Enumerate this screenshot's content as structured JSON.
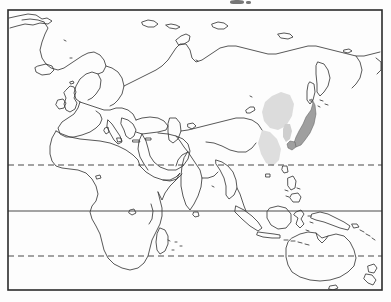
{
  "figure": {
    "kind": "world-outline-map",
    "projection_note": "rectangular cylindrical",
    "centered_on": "Eurasia, Africa, Australia",
    "image_width": 391,
    "image_height": 302,
    "background_color": "#fdfdfd",
    "coastline_color": "#3a3a3a",
    "border_color": "#2b2b2b",
    "gridline_color": "#4a4a4a",
    "shading_color_dark": "#9a9a9a",
    "shading_color_light": "#d6d6d6",
    "title": "",
    "caption": "",
    "labels": []
  },
  "frame": {
    "name": "map-border",
    "x": 8,
    "y": 10,
    "width": 374,
    "height": 280,
    "stroke_width": 1.6
  },
  "gridlines": [
    {
      "name": "tropic-of-cancer",
      "style": "dashed",
      "y": 165,
      "label": ""
    },
    {
      "name": "equator",
      "style": "solid",
      "y": 211,
      "label": ""
    },
    {
      "name": "tropic-of-capricorn",
      "style": "dashed",
      "y": 256,
      "label": ""
    }
  ],
  "shaded_regions": [
    {
      "name": "japan",
      "tone": "dark",
      "label": ""
    },
    {
      "name": "northeast-china-manchuria",
      "tone": "light",
      "label": ""
    },
    {
      "name": "east-china-coast",
      "tone": "light",
      "label": ""
    },
    {
      "name": "korean-peninsula",
      "tone": "light",
      "label": ""
    }
  ],
  "landmasses": [
    {
      "name": "eurasia",
      "label": ""
    },
    {
      "name": "africa",
      "label": ""
    },
    {
      "name": "arabian-peninsula",
      "label": ""
    },
    {
      "name": "india",
      "label": ""
    },
    {
      "name": "southeast-asia",
      "label": ""
    },
    {
      "name": "indonesia",
      "label": ""
    },
    {
      "name": "philippines",
      "label": ""
    },
    {
      "name": "japan",
      "label": ""
    },
    {
      "name": "australia",
      "label": ""
    },
    {
      "name": "new-guinea",
      "label": ""
    },
    {
      "name": "new-zealand",
      "label": ""
    },
    {
      "name": "madagascar",
      "label": ""
    },
    {
      "name": "british-isles",
      "label": ""
    },
    {
      "name": "iceland",
      "label": ""
    },
    {
      "name": "scandinavia",
      "label": ""
    },
    {
      "name": "novaya-zemlya",
      "label": ""
    },
    {
      "name": "svalbard",
      "label": ""
    },
    {
      "name": "sri-lanka",
      "label": ""
    },
    {
      "name": "greenland-edge",
      "label": ""
    },
    {
      "name": "arctic-islands",
      "label": ""
    }
  ],
  "artifacts": [
    {
      "name": "scan-speck-top",
      "x": 230,
      "y": 0,
      "width": 14,
      "height": 4
    },
    {
      "name": "scan-speck-top-edge",
      "x": 246,
      "y": 1,
      "width": 5,
      "height": 3
    }
  ]
}
